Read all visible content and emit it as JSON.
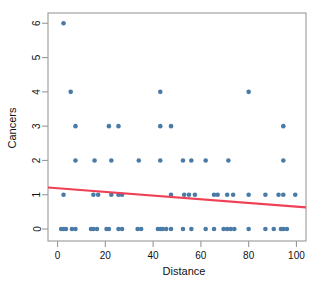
{
  "chart_data": {
    "type": "scatter",
    "title": "",
    "xlabel": "Distance",
    "ylabel": "Cancers",
    "xlim": [
      -4,
      104
    ],
    "ylim": [
      -0.35,
      6.3
    ],
    "xticks": [
      0,
      20,
      40,
      60,
      80,
      100
    ],
    "yticks": [
      0,
      1,
      2,
      3,
      4,
      5,
      6
    ],
    "grid": false,
    "legend": null,
    "point_color": "#4a7ba7",
    "line_color": "#ef4056",
    "axis_color": "#9a9a9a",
    "background": "#ffffff",
    "points": [
      {
        "x": 2.5,
        "y": 6
      },
      {
        "x": 5.5,
        "y": 4
      },
      {
        "x": 43.0,
        "y": 4
      },
      {
        "x": 80.0,
        "y": 4
      },
      {
        "x": 7.5,
        "y": 3
      },
      {
        "x": 21.5,
        "y": 3
      },
      {
        "x": 25.5,
        "y": 3
      },
      {
        "x": 43.0,
        "y": 3
      },
      {
        "x": 47.5,
        "y": 3
      },
      {
        "x": 94.5,
        "y": 3
      },
      {
        "x": 7.5,
        "y": 2
      },
      {
        "x": 15.5,
        "y": 2
      },
      {
        "x": 22.5,
        "y": 2
      },
      {
        "x": 34.0,
        "y": 2
      },
      {
        "x": 43.0,
        "y": 2
      },
      {
        "x": 52.5,
        "y": 2
      },
      {
        "x": 56.0,
        "y": 2
      },
      {
        "x": 62.0,
        "y": 2
      },
      {
        "x": 71.5,
        "y": 2
      },
      {
        "x": 94.5,
        "y": 2
      },
      {
        "x": 2.5,
        "y": 1
      },
      {
        "x": 15.0,
        "y": 1
      },
      {
        "x": 17.0,
        "y": 1
      },
      {
        "x": 22.5,
        "y": 1
      },
      {
        "x": 25.5,
        "y": 1
      },
      {
        "x": 27.0,
        "y": 1
      },
      {
        "x": 47.5,
        "y": 1
      },
      {
        "x": 53.0,
        "y": 1
      },
      {
        "x": 55.0,
        "y": 1
      },
      {
        "x": 57.5,
        "y": 1
      },
      {
        "x": 65.5,
        "y": 1
      },
      {
        "x": 67.0,
        "y": 1
      },
      {
        "x": 71.0,
        "y": 1
      },
      {
        "x": 73.5,
        "y": 1
      },
      {
        "x": 80.0,
        "y": 1
      },
      {
        "x": 87.0,
        "y": 1
      },
      {
        "x": 92.5,
        "y": 1
      },
      {
        "x": 94.5,
        "y": 1
      },
      {
        "x": 99.5,
        "y": 1
      },
      {
        "x": 1.5,
        "y": 0
      },
      {
        "x": 2.5,
        "y": 0
      },
      {
        "x": 3.5,
        "y": 0
      },
      {
        "x": 6.0,
        "y": 0
      },
      {
        "x": 7.5,
        "y": 0
      },
      {
        "x": 14.0,
        "y": 0
      },
      {
        "x": 15.0,
        "y": 0
      },
      {
        "x": 16.5,
        "y": 0
      },
      {
        "x": 20.5,
        "y": 0
      },
      {
        "x": 21.5,
        "y": 0
      },
      {
        "x": 25.5,
        "y": 0
      },
      {
        "x": 27.0,
        "y": 0
      },
      {
        "x": 33.5,
        "y": 0
      },
      {
        "x": 35.0,
        "y": 0
      },
      {
        "x": 42.0,
        "y": 0
      },
      {
        "x": 43.0,
        "y": 0
      },
      {
        "x": 44.0,
        "y": 0
      },
      {
        "x": 45.5,
        "y": 0
      },
      {
        "x": 47.5,
        "y": 0
      },
      {
        "x": 52.5,
        "y": 0
      },
      {
        "x": 56.0,
        "y": 0
      },
      {
        "x": 62.0,
        "y": 0
      },
      {
        "x": 65.5,
        "y": 0
      },
      {
        "x": 69.5,
        "y": 0
      },
      {
        "x": 71.0,
        "y": 0
      },
      {
        "x": 72.5,
        "y": 0
      },
      {
        "x": 74.0,
        "y": 0
      },
      {
        "x": 80.0,
        "y": 0
      },
      {
        "x": 87.0,
        "y": 0
      },
      {
        "x": 90.5,
        "y": 0
      },
      {
        "x": 93.5,
        "y": 0
      },
      {
        "x": 94.5,
        "y": 0
      },
      {
        "x": 96.0,
        "y": 0
      }
    ],
    "trendline": {
      "name": "linear fit",
      "x0": -4,
      "y0": 1.21,
      "x1": 104,
      "y1": 0.63
    }
  }
}
